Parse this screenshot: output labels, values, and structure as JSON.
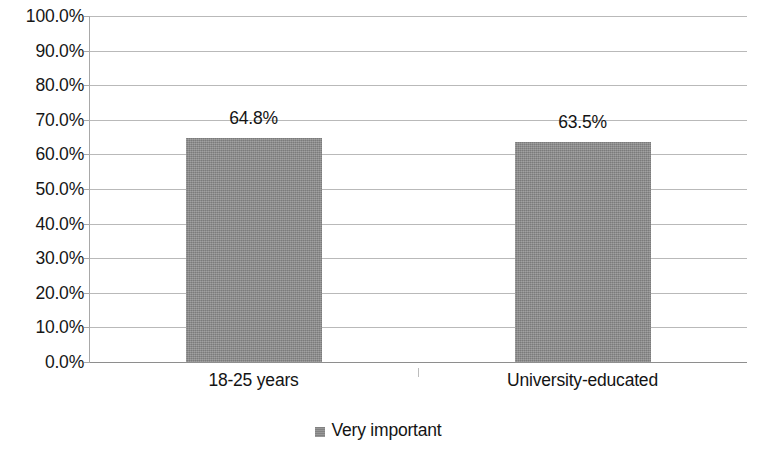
{
  "chart_data": {
    "type": "bar",
    "title": "",
    "subtitle": "",
    "xlabel": "",
    "ylabel": "",
    "categories": [
      "18-25 years",
      "University-educated"
    ],
    "series": [
      {
        "name": "Very important",
        "color": "#8c8c8c",
        "values": [
          64.8,
          63.5
        ],
        "data_labels": [
          "64.8%",
          "63.5%"
        ]
      }
    ],
    "ylim": [
      0,
      100
    ],
    "y_tick_values": [
      100,
      90,
      80,
      70,
      60,
      50,
      40,
      30,
      20,
      10,
      0
    ],
    "y_tick_labels": [
      "100.0%",
      "90.0%",
      "80.0%",
      "70.0%",
      "60.0%",
      "50.0%",
      "40.0%",
      "30.0%",
      "20.0%",
      "10.0%",
      "0.0%"
    ],
    "grid": true,
    "grid_axis": "y",
    "legend_position": "bottom",
    "legend_entries": [
      "Very important"
    ],
    "annotations": []
  }
}
